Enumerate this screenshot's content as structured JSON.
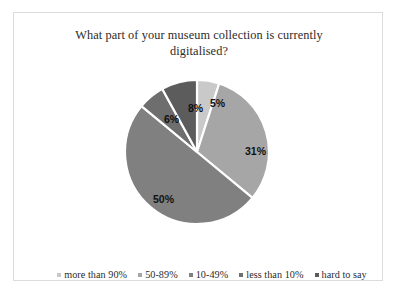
{
  "chart_data": {
    "type": "pie",
    "title": "What part of your museum collection is currently digitalised?",
    "title_line1": "What part of your museum collection is currently",
    "title_line2": "digitalised?",
    "categories": [
      "more than 90%",
      "50-89%",
      "10-49%",
      "less than 10%",
      "hard to say"
    ],
    "values": [
      5,
      31,
      50,
      6,
      8
    ],
    "value_labels": [
      "5%",
      "31%",
      "50%",
      "6%",
      "8%"
    ],
    "colors": [
      "#c9c9c9",
      "#a6a6a6",
      "#808080",
      "#6e6e6e",
      "#5c5c5c"
    ],
    "units": "percent",
    "start_angle_deg": 0,
    "direction": "clockwise",
    "separator_color": "#ffffff",
    "legend_position": "bottom",
    "grid": false,
    "xlabel": "",
    "ylabel": ""
  },
  "chart": {
    "slices": [
      {
        "label": "more than 90%",
        "value": 5,
        "display": "5%",
        "color": "#c9c9c9"
      },
      {
        "label": "50-89%",
        "value": 31,
        "display": "31%",
        "color": "#a6a6a6"
      },
      {
        "label": "10-49%",
        "value": 50,
        "display": "50%",
        "color": "#808080"
      },
      {
        "label": "less than 10%",
        "value": 6,
        "display": "6%",
        "color": "#6e6e6e"
      },
      {
        "label": "hard to say",
        "value": 8,
        "display": "8%",
        "color": "#5c5c5c"
      }
    ]
  },
  "legend": {
    "items": [
      {
        "label": "more than 90%",
        "color": "#c9c9c9"
      },
      {
        "label": "50-89%",
        "color": "#a6a6a6"
      },
      {
        "label": "10-49%",
        "color": "#808080"
      },
      {
        "label": "less than 10%",
        "color": "#6e6e6e"
      },
      {
        "label": "hard to say",
        "color": "#5c5c5c"
      }
    ]
  },
  "frame": {
    "border_color": "#dcdcdc",
    "background": "#ffffff"
  }
}
